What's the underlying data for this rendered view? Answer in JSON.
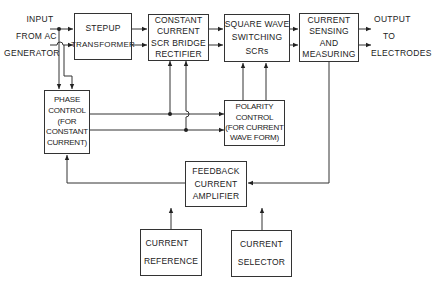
{
  "diagram": {
    "type": "block-diagram",
    "input_label": [
      "INPUT",
      "FROM AC",
      "GENERATOR"
    ],
    "output_label": [
      "OUTPUT",
      "TO",
      "ELECTRODES"
    ],
    "blocks": {
      "stepup": {
        "lines": [
          "STEPUP",
          "TRANSFORMER"
        ]
      },
      "rectifier": {
        "lines": [
          "CONSTANT",
          "CURRENT",
          "SCR BRIDGE",
          "RECTIFIER"
        ]
      },
      "switching": {
        "lines": [
          "SQUARE WAVE",
          "SWITCHING",
          "SCRs"
        ]
      },
      "sensing": {
        "lines": [
          "CURRENT",
          "SENSING",
          "AND",
          "MEASURING"
        ]
      },
      "phase": {
        "lines": [
          "PHASE",
          "CONTROL",
          "(FOR",
          "CONSTANT",
          "CURRENT)"
        ]
      },
      "polarity": {
        "lines": [
          "POLARITY",
          "CONTROL",
          "(FOR CURRENT",
          "WAVE FORM)"
        ]
      },
      "feedback": {
        "lines": [
          "FEEDBACK",
          "CURRENT",
          "AMPLIFIER"
        ]
      },
      "reference": {
        "lines": [
          "CURRENT",
          "REFERENCE"
        ]
      },
      "selector": {
        "lines": [
          "CURRENT",
          "SELECTOR"
        ]
      }
    },
    "connections": [
      {
        "from": "input",
        "to": "stepup"
      },
      {
        "from": "input",
        "to": "phase"
      },
      {
        "from": "stepup",
        "to": "rectifier"
      },
      {
        "from": "rectifier",
        "to": "switching"
      },
      {
        "from": "switching",
        "to": "sensing"
      },
      {
        "from": "sensing",
        "to": "output"
      },
      {
        "from": "phase",
        "to": "rectifier"
      },
      {
        "from": "phase",
        "to": "polarity"
      },
      {
        "from": "polarity",
        "to": "switching"
      },
      {
        "from": "sensing",
        "to": "feedback"
      },
      {
        "from": "feedback",
        "to": "phase"
      },
      {
        "from": "reference",
        "to": "feedback"
      },
      {
        "from": "selector",
        "to": "feedback"
      }
    ]
  }
}
